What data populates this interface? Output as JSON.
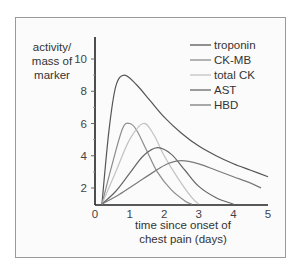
{
  "chart_data": {
    "type": "line",
    "title": "",
    "xlabel": "time since onset of chest pain (days)",
    "xlabel_lines": [
      "time since onset of",
      "chest pain (days)"
    ],
    "ylabel": "activity/ mass of marker",
    "ylabel_lines": [
      "activity/",
      "mass of",
      "marker"
    ],
    "xlim": [
      0,
      5
    ],
    "ylim": [
      1,
      11
    ],
    "xticks": [
      0,
      1,
      2,
      3,
      4,
      5
    ],
    "yticks": [
      2,
      4,
      6,
      8,
      10
    ],
    "grid": false,
    "legend_position": "upper right",
    "series": [
      {
        "name": "troponin",
        "color": "#555555",
        "x": [
          0.2,
          0.4,
          0.6,
          0.85,
          1.2,
          1.6,
          2.0,
          2.5,
          3.0,
          3.5,
          4.0,
          4.5,
          5.0
        ],
        "y": [
          1.0,
          5.5,
          8.3,
          9.0,
          8.4,
          7.4,
          6.4,
          5.4,
          4.6,
          4.0,
          3.5,
          3.1,
          2.7
        ]
      },
      {
        "name": "CK-MB",
        "color": "#8c8c8c",
        "x": [
          0.2,
          0.5,
          0.8,
          1.0,
          1.2,
          1.5,
          1.8,
          2.2,
          2.6,
          2.8
        ],
        "y": [
          1.0,
          3.5,
          5.7,
          6.0,
          5.6,
          4.3,
          3.0,
          1.9,
          1.2,
          1.0
        ]
      },
      {
        "name": "total CK",
        "color": "#c2c2c2",
        "x": [
          0.2,
          0.6,
          1.0,
          1.4,
          1.7,
          2.0,
          2.4,
          2.8,
          3.0
        ],
        "y": [
          1.0,
          3.0,
          5.0,
          6.0,
          5.3,
          4.0,
          2.6,
          1.4,
          1.0
        ]
      },
      {
        "name": "AST",
        "color": "#666666",
        "x": [
          0.2,
          0.6,
          1.0,
          1.4,
          1.8,
          2.2,
          2.6,
          3.0,
          3.5,
          4.0
        ],
        "y": [
          1.0,
          1.8,
          2.9,
          4.0,
          4.5,
          4.1,
          3.1,
          2.1,
          1.4,
          1.0
        ]
      },
      {
        "name": "HBD",
        "color": "#7a7a7a",
        "x": [
          0.2,
          0.7,
          1.2,
          1.7,
          2.1,
          2.5,
          3.0,
          3.5,
          4.0,
          4.5,
          4.8
        ],
        "y": [
          1.0,
          1.6,
          2.3,
          3.0,
          3.5,
          3.7,
          3.5,
          3.1,
          2.7,
          2.3,
          2.0
        ]
      }
    ]
  }
}
